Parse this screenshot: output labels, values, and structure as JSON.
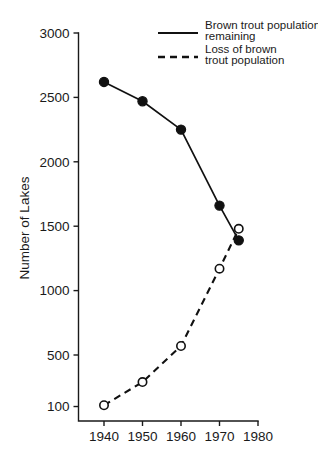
{
  "chart_data": {
    "type": "line",
    "title": "",
    "xlabel": "",
    "ylabel": "Number of Lakes",
    "xlim": [
      1935,
      1980
    ],
    "ylim": [
      100,
      3000
    ],
    "grid": false,
    "legend_position": "top-right",
    "x_ticks": [
      "1940",
      "1950",
      "1960",
      "1970",
      "1980"
    ],
    "x_tick_values": [
      1940,
      1950,
      1960,
      1970,
      1980
    ],
    "y_ticks": [
      "100",
      "500",
      "1000",
      "1500",
      "2000",
      "2500",
      "3000"
    ],
    "y_tick_values": [
      100,
      500,
      1000,
      1500,
      2000,
      2500,
      3000
    ],
    "series": [
      {
        "name": "Brown trout population remaining",
        "style": "solid",
        "marker": "filled-circle",
        "color": "#111111",
        "x": [
          1940,
          1950,
          1960,
          1970,
          1975
        ],
        "values": [
          2620,
          2470,
          2250,
          1660,
          1390
        ]
      },
      {
        "name": "Loss of brown trout population",
        "style": "dashed",
        "marker": "open-circle",
        "color": "#111111",
        "x": [
          1940,
          1950,
          1960,
          1970,
          1975
        ],
        "values": [
          110,
          290,
          570,
          1170,
          1480
        ]
      }
    ]
  },
  "legend": {
    "entries": [
      {
        "line1": "Brown trout population",
        "line2": "remaining",
        "style": "solid"
      },
      {
        "line1": "Loss of brown",
        "line2": "trout population",
        "style": "dashed"
      }
    ]
  },
  "axis": {
    "y_title": "Number of Lakes"
  }
}
